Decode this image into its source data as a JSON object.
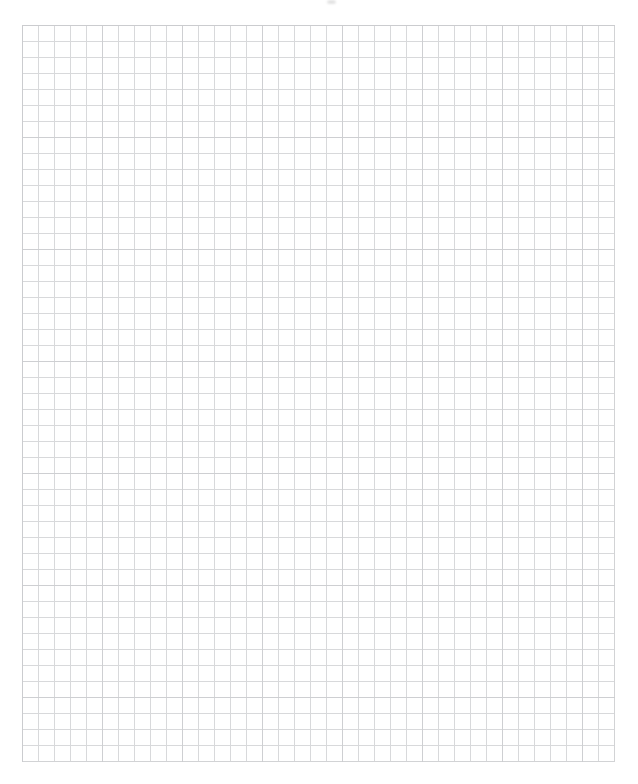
{
  "document": {
    "description": "Blank scanned sheet of quad-ruled graph paper with no writing or markings",
    "background_color": "#ffffff",
    "sheet": {
      "left_px": 22,
      "top_px": 25,
      "width_px": 593,
      "height_px": 737,
      "cell_size_px": 16,
      "columns": 37,
      "rows": 46,
      "paper_color": "#ffffff",
      "line_color": "#d8d9db",
      "line_color_strong": "#c7c8cb"
    },
    "scan_artifacts": [
      {
        "name": "top-center-speck",
        "x_px": 327,
        "y_px": 0,
        "width_px": 9,
        "height_px": 4,
        "color": "#e2e2e2"
      }
    ]
  }
}
